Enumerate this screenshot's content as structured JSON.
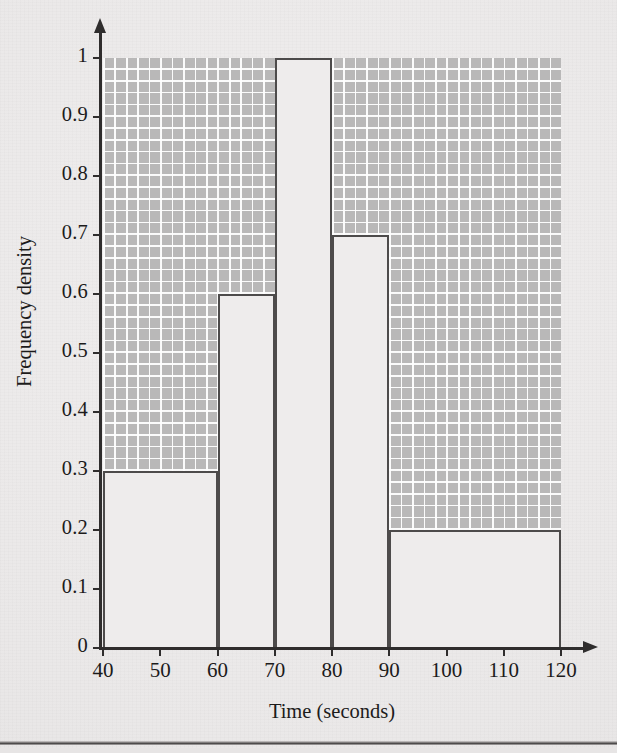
{
  "chart_data": {
    "type": "bar",
    "title": "",
    "subtitle": "",
    "xlabel": "Time (seconds)",
    "ylabel": "Frequency density",
    "xlim": [
      40,
      120
    ],
    "ylim": [
      0,
      1
    ],
    "grid": true,
    "legend": null,
    "legend_position": "none",
    "annotations": [],
    "x_tick_labels": [
      "40",
      "50",
      "60",
      "70",
      "80",
      "90",
      "100",
      "110",
      "120"
    ],
    "x_tick_values": [
      40,
      50,
      60,
      70,
      80,
      90,
      100,
      110,
      120
    ],
    "y_tick_labels": [
      "0",
      "0.1",
      "0.2",
      "0.3",
      "0.4",
      "0.5",
      "0.6",
      "0.7",
      "0.8",
      "0.9",
      "1"
    ],
    "y_tick_values": [
      0,
      0.1,
      0.2,
      0.3,
      0.4,
      0.5,
      0.6,
      0.7,
      0.8,
      0.9,
      1
    ],
    "categories": [
      "40-60",
      "60-70",
      "70-80",
      "80-90",
      "90-120"
    ],
    "values": [
      0.3,
      0.6,
      1.0,
      0.7,
      0.2
    ],
    "bins": [
      {
        "label": "40-60",
        "start": 40,
        "end": 60,
        "frequency_density": 0.3
      },
      {
        "label": "60-70",
        "start": 60,
        "end": 70,
        "frequency_density": 0.6
      },
      {
        "label": "70-80",
        "start": 70,
        "end": 80,
        "frequency_density": 1.0
      },
      {
        "label": "80-90",
        "start": 80,
        "end": 90,
        "frequency_density": 0.7
      },
      {
        "label": "90-120",
        "start": 90,
        "end": 120,
        "frequency_density": 0.2
      }
    ],
    "colors": {
      "bar_fill": "#eeecec",
      "bar_outline": "#4d4b4b",
      "grid_background": "#b9b8b8",
      "grid_minor_line": "#ffffff",
      "grid_major_line": "#5a5858",
      "axis": "#2f2d2d",
      "page_background": "#eceaea",
      "text": "#1c1b1b"
    }
  }
}
